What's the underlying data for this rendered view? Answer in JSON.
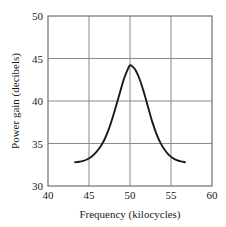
{
  "chart_data": {
    "type": "line",
    "title": "",
    "xlabel": "Frequency (kilocycles)",
    "ylabel": "Power gain (decibels)",
    "xlim": [
      40,
      60
    ],
    "ylim": [
      30,
      50
    ],
    "xticks": [
      40,
      45,
      50,
      55,
      60
    ],
    "yticks": [
      30,
      35,
      40,
      45,
      50
    ],
    "xtick_labels": [
      "40",
      "45",
      "50",
      "55",
      "60"
    ],
    "ytick_labels": [
      "30",
      "35",
      "40",
      "45",
      "50"
    ],
    "grid": true,
    "legend": null,
    "series": [
      {
        "name": "power gain",
        "color": "#1a1a1a",
        "x": [
          43.3,
          43.8,
          44.3,
          44.8,
          45.3,
          45.8,
          46.3,
          46.8,
          47.3,
          47.8,
          48.3,
          48.8,
          49.3,
          49.8,
          50.0,
          50.2,
          50.7,
          51.2,
          51.7,
          52.2,
          52.7,
          53.2,
          53.7,
          54.2,
          54.7,
          55.2,
          55.7,
          56.2,
          56.7
        ],
        "y": [
          32.8,
          32.85,
          32.95,
          33.15,
          33.45,
          33.9,
          34.5,
          35.3,
          36.4,
          37.8,
          39.4,
          41.1,
          42.7,
          43.9,
          44.2,
          44.15,
          43.6,
          42.5,
          41.0,
          39.3,
          37.6,
          36.2,
          35.1,
          34.3,
          33.7,
          33.3,
          33.05,
          32.9,
          32.8
        ]
      }
    ],
    "peak": {
      "x": 50,
      "y": 44.2
    },
    "baseline": 32.8
  },
  "colors": {
    "grid": "#8a8a8a",
    "frame": "#6e6e6e",
    "curve": "#1a1a1a",
    "text": "#1a1a1a",
    "background": "#ffffff"
  }
}
